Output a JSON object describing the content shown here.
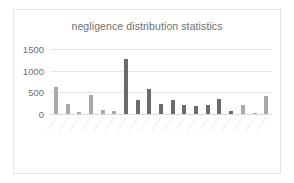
{
  "chart_data": {
    "type": "bar",
    "title": "negligence distribution statistics",
    "xlabel": "",
    "ylabel": "",
    "ylim": [
      0,
      1500
    ],
    "yticks": [
      0,
      500,
      1000,
      1500
    ],
    "ytick_labels": [
      "0",
      "500",
      "1000",
      "1500"
    ],
    "grid": true,
    "legend": false,
    "legend_position": "none",
    "note": "Category axis labels are rotated ~55 degrees and rendered too small to resolve in the source image.",
    "categories": [
      "category-1",
      "category-2",
      "category-3",
      "category-4",
      "category-5",
      "category-6",
      "category-7",
      "category-8",
      "category-9",
      "category-10",
      "category-11",
      "category-12",
      "category-13",
      "category-14",
      "category-15",
      "category-16",
      "category-17",
      "category-18",
      "category-19"
    ],
    "category_labels": [
      "",
      "",
      "",
      "",
      "",
      "",
      "",
      "",
      "",
      "",
      "",
      "",
      "",
      "",
      "",
      "",
      "",
      "",
      ""
    ],
    "values": [
      620,
      230,
      40,
      450,
      85,
      70,
      1270,
      330,
      570,
      240,
      330,
      205,
      190,
      215,
      335,
      60,
      210,
      0,
      415
    ],
    "bar_shades": [
      "light",
      "light",
      "light",
      "light",
      "light",
      "light",
      "dark",
      "dark",
      "dark",
      "dark",
      "dark",
      "dark",
      "dark",
      "dark",
      "dark",
      "dark",
      "light",
      "light",
      "light"
    ]
  },
  "colors": {
    "bar_light": "#a9a9a9",
    "bar_dark": "#6b6b6b",
    "gridline": "#e6e6e6",
    "text": "#6f6f6f",
    "frame_border": "#e3e3e3",
    "background": "#ffffff"
  }
}
